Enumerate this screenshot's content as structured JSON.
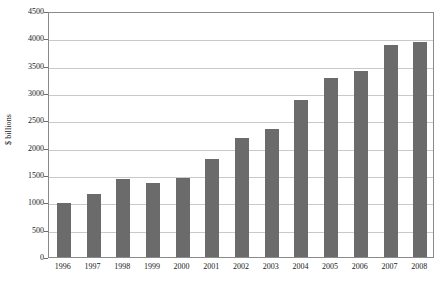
{
  "chart_data": {
    "type": "bar",
    "title": "",
    "subtitle": "",
    "xlabel": "",
    "ylabel": "$ billions",
    "categories": [
      "1996",
      "1997",
      "1998",
      "1999",
      "2000",
      "2001",
      "2002",
      "2003",
      "2004",
      "2005",
      "2006",
      "2007",
      "2008"
    ],
    "values": [
      980,
      1150,
      1420,
      1360,
      1450,
      1790,
      2170,
      2350,
      2880,
      3280,
      3400,
      3880,
      3930
    ],
    "ylim": [
      0,
      4500
    ],
    "ytick_values": [
      0,
      500,
      1000,
      1500,
      2000,
      2500,
      3000,
      3500,
      4000,
      4500
    ],
    "ytick_labels": [
      "0",
      "500",
      "1000",
      "1500",
      "2000",
      "2500",
      "3000",
      "3500",
      "4000",
      "4500"
    ],
    "grid": true,
    "legend": null,
    "legend_position": "none",
    "annotations": [],
    "series": [
      {
        "name": "$ billions",
        "values": [
          980,
          1150,
          1420,
          1360,
          1450,
          1790,
          2170,
          2350,
          2880,
          3280,
          3400,
          3880,
          3930
        ]
      }
    ]
  },
  "colors": {
    "bar_fill": "#6b6b6b",
    "gridline": "#c9c9c9",
    "axis": "#8a8a8a",
    "text": "#1a1a1a",
    "background": "#ffffff"
  }
}
